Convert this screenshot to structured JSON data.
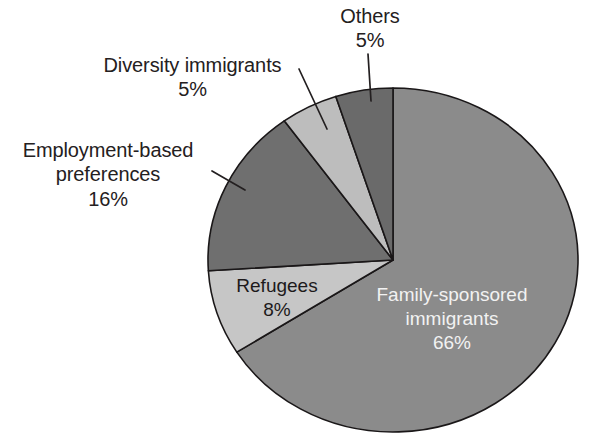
{
  "chart_data": {
    "type": "pie",
    "title": "",
    "subtitle": "",
    "xlabel": "",
    "ylabel": "",
    "legend_position": "none",
    "grid": false,
    "total": 100,
    "unit": "%",
    "start_angle_deg": 0,
    "direction": "clockwise",
    "categories": [
      "Family-sponsored immigrants",
      "Refugees",
      "Employment-based preferences",
      "Diversity immigrants",
      "Others"
    ],
    "values": [
      66,
      8,
      16,
      5,
      5
    ],
    "slices": [
      {
        "label": "Family-sponsored immigrants",
        "label_line1": "Family-sponsored",
        "label_line2": "immigrants",
        "value": 66,
        "pct_text": "66%",
        "color": "#8b8b8b",
        "label_placement": "inside",
        "label_color": "#f2f2f2"
      },
      {
        "label": "Refugees",
        "label_line1": "Refugees",
        "label_line2": "",
        "value": 8,
        "pct_text": "8%",
        "color": "#c6c6c6",
        "label_placement": "inside",
        "label_color": "#1d1a1b"
      },
      {
        "label": "Employment-based preferences",
        "label_line1": "Employment-based",
        "label_line2": "preferences",
        "value": 16,
        "pct_text": "16%",
        "color": "#6f6f6f",
        "label_placement": "outside",
        "label_color": "#242021"
      },
      {
        "label": "Diversity immigrants",
        "label_line1": "Diversity immigrants",
        "label_line2": "",
        "value": 5,
        "pct_text": "5%",
        "color": "#bdbdbd",
        "label_placement": "outside",
        "label_color": "#242021"
      },
      {
        "label": "Others",
        "label_line1": "Others",
        "label_line2": "",
        "value": 5,
        "pct_text": "5%",
        "color": "#6a6a6a",
        "label_placement": "outside",
        "label_color": "#242021"
      }
    ],
    "colors": {
      "family_sponsored": "#8b8b8b",
      "refugees": "#c6c6c6",
      "employment_based": "#6f6f6f",
      "diversity": "#bdbdbd",
      "others": "#6a6a6a",
      "outline": "#1a1718",
      "background": "#ffffff",
      "text_dark": "#242021",
      "text_light": "#f2f2f2"
    }
  },
  "labels": {
    "others": {
      "name": "Others",
      "pct": "5%"
    },
    "diversity": {
      "name": "Diversity immigrants",
      "pct": "5%"
    },
    "employment": {
      "name_line1": "Employment-based",
      "name_line2": "preferences",
      "pct": "16%"
    },
    "refugees": {
      "name": "Refugees",
      "pct": "8%"
    },
    "family": {
      "name_line1": "Family-sponsored",
      "name_line2": "immigrants",
      "pct": "66%"
    }
  }
}
